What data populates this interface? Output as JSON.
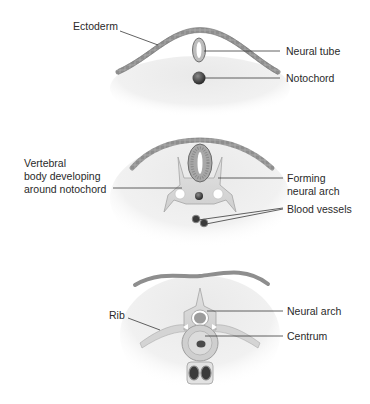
{
  "figure": {
    "panels": [
      {
        "id": "stage-1",
        "labels": {
          "ectoderm": "Ectoderm",
          "neural_tube": "Neural tube",
          "notochord": "Notochord"
        }
      },
      {
        "id": "stage-2",
        "labels": {
          "vertebral_body_1": "Vertebral",
          "vertebral_body_2": "body developing",
          "vertebral_body_3": "around notochord",
          "forming_arch_1": "Forming",
          "forming_arch_2": "neural arch",
          "blood_vessels": "Blood vessels"
        }
      },
      {
        "id": "stage-3",
        "labels": {
          "rib": "Rib",
          "neural_arch": "Neural arch",
          "centrum": "Centrum"
        }
      }
    ]
  },
  "colors": {
    "tissue": "#ececec",
    "ectoderm": "#9a9a9a",
    "bone": "#d6d6d6",
    "dark": "#3c3c3c",
    "line": "#3a3a3a"
  }
}
